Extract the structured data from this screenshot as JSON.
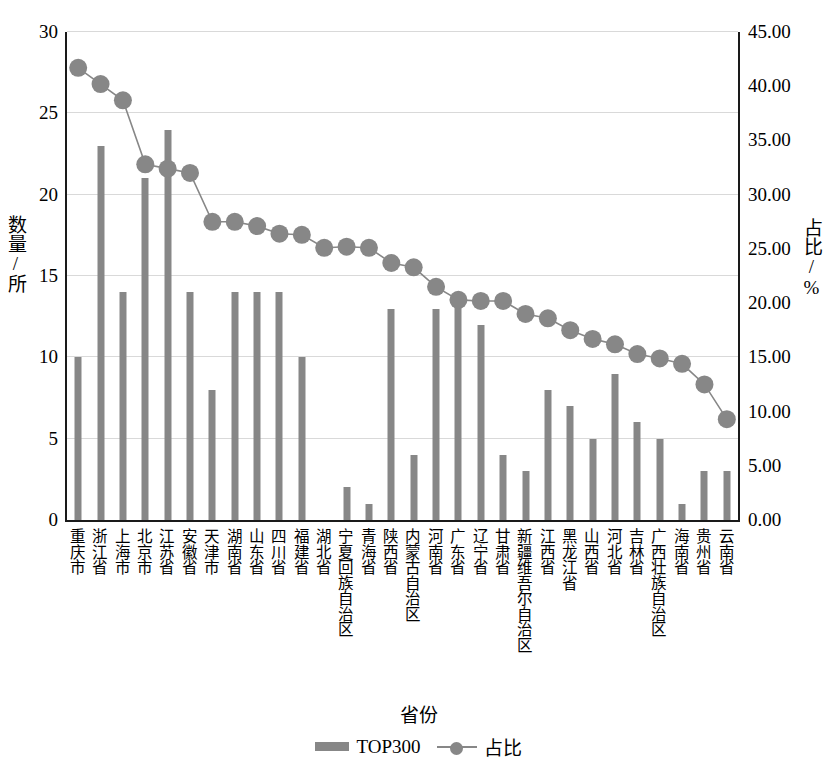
{
  "chart_data": {
    "type": "bar",
    "title": "",
    "xlabel": "省份",
    "ylabel": "数量/所",
    "y2label": "占比/%",
    "grid": true,
    "legend_position": "bottom",
    "ylim": [
      0,
      30
    ],
    "y2lim": [
      0,
      45
    ],
    "y_ticks": [
      "0",
      "5",
      "10",
      "15",
      "20",
      "25",
      "30"
    ],
    "y2_ticks": [
      "0.00",
      "5.00",
      "10.00",
      "15.00",
      "20.00",
      "25.00",
      "30.00",
      "35.00",
      "40.00",
      "45.00"
    ],
    "categories": [
      "重庆市",
      "浙江省",
      "上海市",
      "北京市",
      "江苏省",
      "安徽省",
      "天津市",
      "湖南省",
      "山东省",
      "四川省",
      "福建省",
      "湖北省",
      "宁夏回族自治区",
      "青海省",
      "陕西省",
      "内蒙古自治区",
      "河南省",
      "广东省",
      "辽宁省",
      "甘肃省",
      "新疆维吾尔自治区",
      "江西省",
      "黑龙江省",
      "山西省",
      "河北省",
      "吉林省",
      "广西壮族自治区",
      "海南省",
      "贵州省",
      "云南省"
    ],
    "series": [
      {
        "name": "TOP300",
        "type": "bar",
        "axis": "left",
        "color": "#878787",
        "values": [
          10,
          23,
          14,
          21,
          24,
          14,
          8,
          14,
          14,
          14,
          10,
          0,
          2,
          1,
          13,
          4,
          13,
          14,
          12,
          4,
          3,
          8,
          7,
          5,
          9,
          6,
          5,
          1,
          3,
          3
        ]
      },
      {
        "name": "占比",
        "type": "line",
        "axis": "right",
        "color": "#878787",
        "values": [
          41.7,
          40.2,
          38.7,
          32.8,
          32.4,
          32.0,
          27.5,
          27.5,
          27.1,
          26.4,
          26.3,
          25.1,
          25.2,
          25.1,
          23.7,
          23.3,
          21.5,
          20.3,
          20.2,
          20.2,
          19.0,
          18.6,
          17.5,
          16.7,
          16.2,
          15.3,
          14.9,
          14.4,
          12.5,
          9.3
        ]
      }
    ]
  },
  "axes": {
    "left_title": "数量/所",
    "right_title": "占比/%",
    "x_title": "省份"
  },
  "legend": {
    "items": [
      {
        "label": "TOP300",
        "kind": "bar"
      },
      {
        "label": "占比",
        "kind": "line"
      }
    ]
  }
}
